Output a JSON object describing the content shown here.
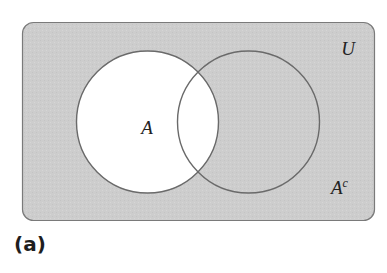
{
  "diagram": {
    "type": "venn",
    "universe": {
      "label": "U",
      "fill": "#cfcfcf",
      "stroke": "#7a7a7a"
    },
    "sets": [
      {
        "id": "A",
        "label": "A",
        "fill": "#ffffff",
        "stroke": "#6e6e6e"
      },
      {
        "id": "B",
        "label": "",
        "fill": "none",
        "stroke": "#6e6e6e"
      }
    ],
    "complement_label": {
      "base": "A",
      "superscript": "c"
    },
    "shaded_region": "complement of A (A^c)",
    "caption": "(a)"
  }
}
